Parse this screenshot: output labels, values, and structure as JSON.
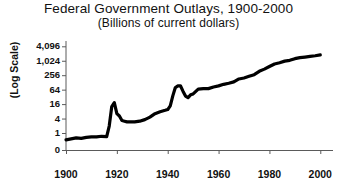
{
  "chart_data": {
    "type": "line",
    "title": "Federal Government Outlays, 1900-2000",
    "subtitle": "(Billions of current dollars)",
    "xlabel": "",
    "ylabel": "(Log Scale)",
    "yscale": "log",
    "grid": false,
    "legend": "none",
    "ylim": [
      0,
      4096
    ],
    "xlim": [
      1900,
      2005
    ],
    "ytick_labels": [
      "4,096",
      "1,024",
      "256",
      "64",
      "16",
      "4",
      "1",
      "0"
    ],
    "ytick_values": [
      4096,
      1024,
      256,
      64,
      16,
      4,
      1,
      0
    ],
    "xtick_labels": [
      "1900",
      "1920",
      "1940",
      "1960",
      "1980",
      "2000"
    ],
    "xtick_values": [
      1900,
      1920,
      1940,
      1960,
      1980,
      2000
    ],
    "series_name": "Federal Outlays",
    "line_color": "#000000",
    "x": [
      1900,
      1902,
      1904,
      1906,
      1908,
      1910,
      1912,
      1914,
      1916,
      1917,
      1918,
      1919,
      1920,
      1921,
      1922,
      1923,
      1924,
      1925,
      1927,
      1929,
      1931,
      1933,
      1935,
      1937,
      1939,
      1940,
      1941,
      1942,
      1943,
      1944,
      1945,
      1946,
      1947,
      1948,
      1949,
      1950,
      1952,
      1954,
      1956,
      1958,
      1960,
      1962,
      1964,
      1966,
      1968,
      1970,
      1972,
      1974,
      1976,
      1978,
      1980,
      1982,
      1984,
      1986,
      1988,
      1990,
      1992,
      1994,
      1996,
      1998,
      2000
    ],
    "y": [
      0.52,
      0.57,
      0.63,
      0.6,
      0.66,
      0.69,
      0.69,
      0.73,
      0.71,
      1.95,
      12.7,
      18.5,
      6.4,
      5.1,
      3.3,
      3.1,
      2.9,
      2.9,
      2.9,
      3.1,
      3.6,
      4.6,
      6.4,
      7.7,
      8.8,
      9.5,
      13.6,
      35.1,
      78.5,
      91.3,
      92.7,
      55.2,
      34.5,
      29.7,
      38.8,
      42.5,
      67.7,
      70.9,
      70.6,
      82.4,
      92.1,
      106.8,
      118.5,
      134.5,
      178.1,
      195.6,
      230.7,
      269.4,
      371.8,
      458.7,
      590.9,
      745.7,
      851.8,
      990.3,
      1064.4,
      1253.0,
      1381.5,
      1461.8,
      1560.5,
      1652.5,
      1789.0
    ]
  },
  "meta": {
    "axis_color": "#5a5a5a",
    "background": "#ffffff",
    "text_color": "#111111"
  }
}
